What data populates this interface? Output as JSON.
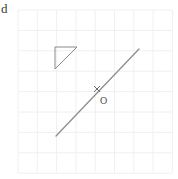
{
  "figure": {
    "canvas": {
      "width": 178,
      "height": 179,
      "background": "#ffffff"
    },
    "corner_artifact": {
      "text": "d",
      "x": 1,
      "y": 2,
      "color": "#3a3a3a"
    },
    "grid": {
      "color": "#f0f0f2",
      "line_width": 1,
      "x_start": 18,
      "y_start": 10,
      "cell_width": 19.3,
      "cell_height": 20.4,
      "columns": 8,
      "rows": 8,
      "x_end": 172,
      "y_end": 173
    },
    "shapes": [
      {
        "name": "right-triangle",
        "type": "polygon",
        "stroke": "#8a8a90",
        "stroke_width": 1,
        "fill": "none",
        "points": "55,47 77,47 55,69"
      },
      {
        "name": "diagonal-line",
        "type": "line",
        "stroke": "#8a8a90",
        "stroke_width": 1.2,
        "x1": 56,
        "y1": 136,
        "x2": 139,
        "y2": 49
      },
      {
        "name": "point-marker-x",
        "type": "cross",
        "stroke": "#6a6a70",
        "stroke_width": 1,
        "cx": 97,
        "cy": 89,
        "size": 6
      }
    ],
    "labels": [
      {
        "name": "point-o-label",
        "text": "O",
        "x": 100,
        "y": 96
      }
    ]
  },
  "chart_data": {
    "type": "scatter",
    "xlabel": "",
    "ylabel": "",
    "grid": true,
    "legend": "none",
    "xlim": [
      0,
      8
    ],
    "ylim": [
      0,
      8
    ],
    "annotations": [
      "O"
    ],
    "series": [
      {
        "name": "right-triangle",
        "type": "polygon",
        "x": [
          1.9,
          3.1,
          1.9
        ],
        "y": [
          6.2,
          6.2,
          5.1
        ]
      },
      {
        "name": "diagonal-line",
        "type": "line",
        "x": [
          2.0,
          6.3
        ],
        "y": [
          1.8,
          6.1
        ]
      },
      {
        "name": "point-O",
        "type": "point",
        "x": [
          4.1
        ],
        "y": [
          4.1
        ]
      }
    ]
  }
}
